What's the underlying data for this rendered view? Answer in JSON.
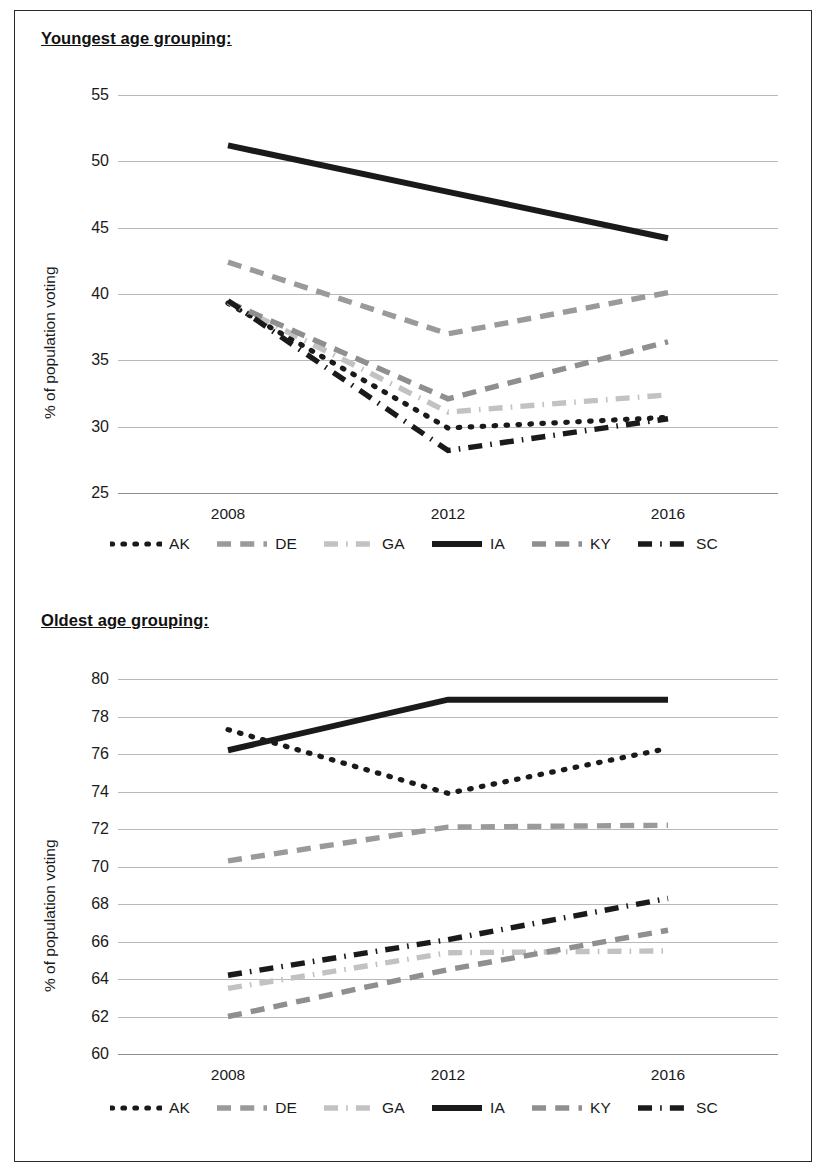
{
  "figure": {
    "sections": [
      {
        "title": "Youngest age grouping:"
      },
      {
        "title": "Oldest age grouping:"
      }
    ],
    "legend": [
      {
        "name": "AK",
        "style": "dotted",
        "color": "#1a1a1a"
      },
      {
        "name": "DE",
        "style": "dashed",
        "color": "#9a9a9a"
      },
      {
        "name": "GA",
        "style": "dashdot",
        "color": "#c2c2c2"
      },
      {
        "name": "IA",
        "style": "solid",
        "color": "#1a1a1a"
      },
      {
        "name": "KY",
        "style": "dashed",
        "color": "#8f8f8f"
      },
      {
        "name": "SC",
        "style": "dashdot",
        "color": "#1a1a1a"
      }
    ]
  },
  "chart_data": [
    {
      "type": "line",
      "title": "Youngest age grouping:",
      "xlabel": "",
      "ylabel": "% of population voting",
      "x": [
        "2008",
        "2012",
        "2016"
      ],
      "categories": [
        "2008",
        "2012",
        "2016"
      ],
      "ylim": [
        25,
        55
      ],
      "yticks": [
        25,
        30,
        35,
        40,
        45,
        50,
        55
      ],
      "grid": true,
      "legend_position": "bottom",
      "series": [
        {
          "name": "AK",
          "values": [
            39.3,
            29.9,
            30.7
          ],
          "style": "dotted",
          "color": "#1a1a1a"
        },
        {
          "name": "DE",
          "values": [
            42.4,
            37.0,
            40.1
          ],
          "style": "dashed",
          "color": "#9a9a9a"
        },
        {
          "name": "GA",
          "values": [
            39.4,
            31.1,
            32.4
          ],
          "style": "dashdot",
          "color": "#c2c2c2"
        },
        {
          "name": "IA",
          "values": [
            51.2,
            47.7,
            44.2
          ],
          "style": "solid",
          "color": "#1a1a1a"
        },
        {
          "name": "KY",
          "values": [
            39.4,
            32.1,
            36.4
          ],
          "style": "dashed",
          "color": "#8f8f8f"
        },
        {
          "name": "SC",
          "values": [
            39.5,
            28.2,
            30.6
          ],
          "style": "dashdot",
          "color": "#1a1a1a"
        }
      ]
    },
    {
      "type": "line",
      "title": "Oldest age grouping:",
      "xlabel": "",
      "ylabel": "% of population voting",
      "x": [
        "2008",
        "2012",
        "2016"
      ],
      "categories": [
        "2008",
        "2012",
        "2016"
      ],
      "ylim": [
        60,
        80
      ],
      "yticks": [
        60,
        62,
        64,
        66,
        68,
        70,
        72,
        74,
        76,
        78,
        80
      ],
      "grid": true,
      "legend_position": "bottom",
      "series": [
        {
          "name": "AK",
          "values": [
            77.3,
            73.9,
            76.3
          ],
          "style": "dotted",
          "color": "#1a1a1a"
        },
        {
          "name": "DE",
          "values": [
            70.3,
            72.1,
            72.2
          ],
          "style": "dashed",
          "color": "#9a9a9a"
        },
        {
          "name": "GA",
          "values": [
            63.5,
            65.4,
            65.5
          ],
          "style": "dashdot",
          "color": "#c2c2c2"
        },
        {
          "name": "IA",
          "values": [
            76.2,
            78.9,
            78.9
          ],
          "style": "solid",
          "color": "#1a1a1a"
        },
        {
          "name": "KY",
          "values": [
            62.0,
            64.5,
            66.6
          ],
          "style": "dashed",
          "color": "#8f8f8f"
        },
        {
          "name": "SC",
          "values": [
            64.2,
            66.1,
            68.3
          ],
          "style": "dashdot",
          "color": "#1a1a1a"
        }
      ]
    }
  ]
}
